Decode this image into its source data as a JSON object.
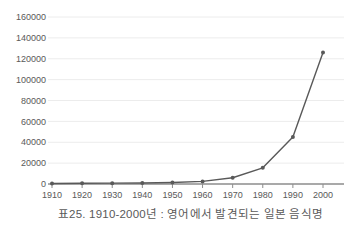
{
  "chart_data": {
    "type": "line",
    "title": "표25. 1910-2000년 : 영어에서 발견되는 일본 음식명",
    "x": [
      1910,
      1920,
      1930,
      1940,
      1950,
      1960,
      1970,
      1980,
      1990,
      2000
    ],
    "series": [
      {
        "name": "일본 음식명",
        "values": [
          500,
          700,
          800,
          1000,
          1500,
          2500,
          6000,
          15500,
          45000,
          126000
        ]
      }
    ],
    "xlabel": "",
    "ylabel": "",
    "ylim": [
      0,
      160000
    ],
    "ytick_step": 20000,
    "ytick_labels": [
      "0",
      "20000",
      "40000",
      "60000",
      "80000",
      "100000",
      "120000",
      "140000",
      "160000"
    ],
    "xtick_labels": [
      "1910",
      "1920",
      "1930",
      "1940",
      "1950",
      "1960",
      "1970",
      "1980",
      "1990",
      "2000"
    ],
    "grid": "horizontal",
    "legend": "none",
    "colors": {
      "line": "#595959",
      "marker": "#595959",
      "grid": "#ececec",
      "axis": "#8c8c8c",
      "tick": "#8c8c8c",
      "tick_label": "#595959",
      "caption": "#595959",
      "background": "#ffffff"
    }
  }
}
